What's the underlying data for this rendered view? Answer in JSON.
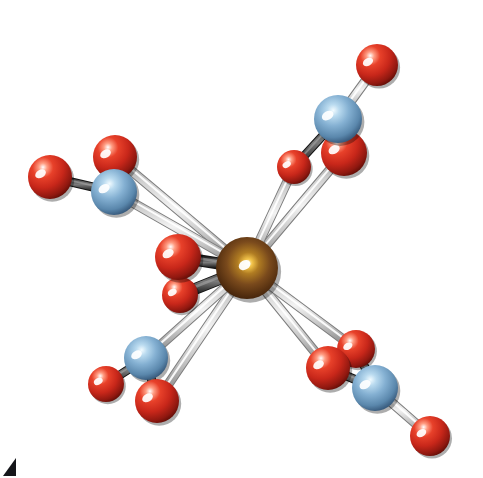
{
  "figure": {
    "width": 483,
    "height": 478,
    "background_color": "#ffffff",
    "corner_mark": {
      "name": "figure-label-fragment",
      "color": "#15161a",
      "x": 3,
      "y": 458
    }
  },
  "palette": {
    "oxygen_base": "#c8271a",
    "oxygen_mid": "#e0351f",
    "oxygen_dark": "#6d1008",
    "oxygen_highlight": "#ffffff",
    "nitrogen_base": "#6f9fc4",
    "nitrogen_mid": "#86b3d4",
    "nitrogen_dark": "#21374d",
    "nitrogen_highlight": "#e8f3fb",
    "metal_base": "#7a4a1c",
    "metal_mid": "#c89030",
    "metal_dark": "#2a1405",
    "metal_highlight": "#ffe9a8",
    "bond_light": "#d2d2d2",
    "bond_light_edge": "#8e8e8e",
    "bond_dark": "#4a4a4a",
    "bond_dark_edge": "#202020"
  },
  "legend": {
    "metal_label": "M",
    "nitrogen_label": "N",
    "oxygen_label": "O"
  },
  "atoms": [
    {
      "id": "M1",
      "element": "M",
      "label": "M",
      "x": 247,
      "y": 268,
      "r": 31,
      "color": "#7a4a1c",
      "group": "center"
    },
    {
      "id": "O1",
      "element": "O",
      "label": "O",
      "x": 178,
      "y": 257,
      "r": 23,
      "color": "#c8271a",
      "group": "inner"
    },
    {
      "id": "O2",
      "element": "O",
      "label": "O",
      "x": 180,
      "y": 295,
      "r": 18,
      "color": "#c8271a",
      "group": "inner"
    },
    {
      "id": "N_tl",
      "element": "N",
      "label": "N",
      "x": 114,
      "y": 192,
      "r": 23,
      "color": "#6f9fc4",
      "group": "nitrate-top-left"
    },
    {
      "id": "O_tl_a",
      "element": "O",
      "label": "O",
      "x": 50,
      "y": 177,
      "r": 22,
      "color": "#c8271a",
      "group": "nitrate-top-left"
    },
    {
      "id": "O_tl_b",
      "element": "O",
      "label": "O",
      "x": 115,
      "y": 157,
      "r": 22,
      "color": "#c8271a",
      "group": "nitrate-top-left"
    },
    {
      "id": "N_tr",
      "element": "N",
      "label": "N",
      "x": 338,
      "y": 119,
      "r": 24,
      "color": "#6f9fc4",
      "group": "nitrate-top-right"
    },
    {
      "id": "O_tr_a",
      "element": "O",
      "label": "O",
      "x": 377,
      "y": 65,
      "r": 21,
      "color": "#c8271a",
      "group": "nitrate-top-right"
    },
    {
      "id": "O_tr_b",
      "element": "O",
      "label": "O",
      "x": 344,
      "y": 153,
      "r": 23,
      "color": "#c8271a",
      "group": "nitrate-top-right"
    },
    {
      "id": "O_tr_c",
      "element": "O",
      "label": "O",
      "x": 294,
      "y": 167,
      "r": 17,
      "color": "#c8271a",
      "group": "nitrate-top-right"
    },
    {
      "id": "N_bl",
      "element": "N",
      "label": "N",
      "x": 146,
      "y": 358,
      "r": 22,
      "color": "#6f9fc4",
      "group": "nitrate-bottom-left"
    },
    {
      "id": "O_bl_a",
      "element": "O",
      "label": "O",
      "x": 106,
      "y": 384,
      "r": 18,
      "color": "#c8271a",
      "group": "nitrate-bottom-left"
    },
    {
      "id": "O_bl_b",
      "element": "O",
      "label": "O",
      "x": 157,
      "y": 401,
      "r": 22,
      "color": "#c8271a",
      "group": "nitrate-bottom-left"
    },
    {
      "id": "N_br",
      "element": "N",
      "label": "N",
      "x": 375,
      "y": 388,
      "r": 23,
      "color": "#6f9fc4",
      "group": "nitrate-bottom-right"
    },
    {
      "id": "O_br_a",
      "element": "O",
      "label": "O",
      "x": 328,
      "y": 368,
      "r": 22,
      "color": "#c8271a",
      "group": "nitrate-bottom-right"
    },
    {
      "id": "O_br_b",
      "element": "O",
      "label": "O",
      "x": 356,
      "y": 349,
      "r": 19,
      "color": "#c8271a",
      "group": "nitrate-bottom-right"
    },
    {
      "id": "O_br_c",
      "element": "O",
      "label": "O",
      "x": 430,
      "y": 436,
      "r": 20,
      "color": "#c8271a",
      "group": "nitrate-bottom-right"
    }
  ],
  "bonds": [
    {
      "from": "N_tl",
      "to": "O_tl_a",
      "style": "dark",
      "width": 7
    },
    {
      "from": "N_tl",
      "to": "O_tl_b",
      "style": "dark",
      "width": 7
    },
    {
      "from": "N_tr",
      "to": "O_tr_a",
      "style": "light",
      "width": 8
    },
    {
      "from": "N_tr",
      "to": "O_tr_b",
      "style": "dark",
      "width": 7
    },
    {
      "from": "N_tr",
      "to": "O_tr_c",
      "style": "dark",
      "width": 7
    },
    {
      "from": "N_bl",
      "to": "O_bl_a",
      "style": "dark",
      "width": 7
    },
    {
      "from": "N_bl",
      "to": "O_bl_b",
      "style": "dark",
      "width": 7
    },
    {
      "from": "N_br",
      "to": "O_br_a",
      "style": "dark",
      "width": 7
    },
    {
      "from": "N_br",
      "to": "O_br_b",
      "style": "dark",
      "width": 7
    },
    {
      "from": "N_br",
      "to": "O_br_c",
      "style": "light",
      "width": 8
    },
    {
      "from": "M1",
      "to": "O1",
      "style": "dark",
      "width": 10
    },
    {
      "from": "M1",
      "to": "O2",
      "style": "dark",
      "width": 10
    },
    {
      "from": "M1",
      "to": "O_tl_b",
      "style": "light",
      "width": 8
    },
    {
      "from": "M1",
      "to": "O_tr_b",
      "style": "light",
      "width": 8
    },
    {
      "from": "M1",
      "to": "O_tr_c",
      "style": "light",
      "width": 8
    },
    {
      "from": "M1",
      "to": "O_bl_b",
      "style": "light",
      "width": 8
    },
    {
      "from": "M1",
      "to": "O_br_a",
      "style": "light",
      "width": 8
    },
    {
      "from": "M1",
      "to": "O_br_b",
      "style": "light",
      "width": 8
    },
    {
      "from": "M1",
      "to": "N_tl",
      "style": "light",
      "width": 8
    },
    {
      "from": "M1",
      "to": "N_bl",
      "style": "light",
      "width": 8
    }
  ],
  "composition": {
    "metal_count": 1,
    "nitrogen_count": 4,
    "oxygen_count": 12,
    "nitrate_group_count": 4,
    "total_atoms": 17
  }
}
